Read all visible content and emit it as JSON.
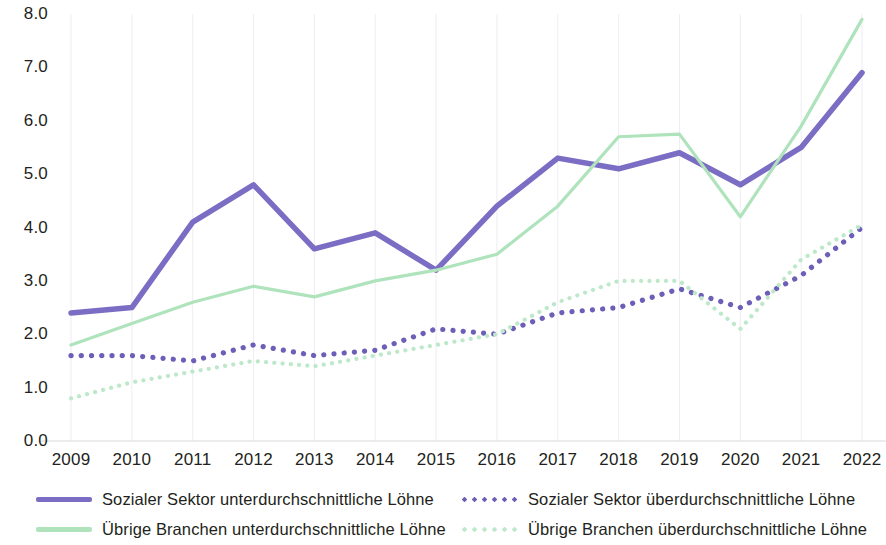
{
  "chart_data": {
    "type": "line",
    "title": "",
    "subtitle": "",
    "xlabel": "",
    "ylabel": "",
    "grid": "vertical-only",
    "legend_position": "bottom",
    "ylim": [
      0.0,
      8.0
    ],
    "ytick_labels": [
      "8.0",
      "7.0",
      "6.0",
      "5.0",
      "4.0",
      "3.0",
      "2.0",
      "1.0",
      "0.0"
    ],
    "ytick_values": [
      8.0,
      7.0,
      6.0,
      5.0,
      4.0,
      3.0,
      2.0,
      1.0,
      0.0
    ],
    "categories": [
      "2009",
      "2010",
      "2011",
      "2012",
      "2013",
      "2014",
      "2015",
      "2016",
      "2017",
      "2018",
      "2019",
      "2020",
      "2021",
      "2022"
    ],
    "x": [
      2009,
      2010,
      2011,
      2012,
      2013,
      2014,
      2015,
      2016,
      2017,
      2018,
      2019,
      2020,
      2021,
      2022
    ],
    "series": [
      {
        "name": "Sozialer Sektor unterdurchschnittliche Löhne",
        "color": "#7B6CC4",
        "style": "solid",
        "values": [
          2.4,
          2.5,
          4.1,
          4.8,
          3.6,
          3.9,
          3.2,
          4.4,
          5.3,
          5.1,
          5.4,
          4.8,
          5.5,
          6.9
        ]
      },
      {
        "name": "Sozialer Sektor überdurchschnittliche Löhne",
        "color": "#6D5FB8",
        "style": "dotted",
        "values": [
          1.6,
          1.6,
          1.5,
          1.8,
          1.6,
          1.7,
          2.1,
          2.0,
          2.4,
          2.5,
          2.85,
          2.5,
          3.1,
          4.0
        ]
      },
      {
        "name": "Übrige Branchen unterdurchschnittliche Löhne",
        "color": "#AEE3BC",
        "style": "solid",
        "values": [
          1.8,
          2.2,
          2.6,
          2.9,
          2.7,
          3.0,
          3.2,
          3.5,
          4.4,
          5.7,
          5.75,
          4.2,
          5.9,
          7.9
        ]
      },
      {
        "name": "Übrige Branchen überdurchschnittliche Löhne",
        "color": "#BEE8CA",
        "style": "dotted",
        "values": [
          0.8,
          1.1,
          1.3,
          1.5,
          1.4,
          1.6,
          1.8,
          2.0,
          2.6,
          3.0,
          3.0,
          2.1,
          3.4,
          4.05
        ]
      }
    ]
  },
  "legend": {
    "rows": [
      [
        {
          "label": "Sozialer Sektor unterdurchschnittliche Löhne",
          "color": "#7B6CC4",
          "style": "solid",
          "name": "legend-sozialer-sektor-unter"
        },
        {
          "label": "Sozialer Sektor überdurchschnittliche Löhne",
          "color": "#6D5FB8",
          "style": "dotted",
          "name": "legend-sozialer-sektor-ueber"
        }
      ],
      [
        {
          "label": "Übrige Branchen unterdurchschnittliche Löhne",
          "color": "#AEE3BC",
          "style": "solid",
          "name": "legend-uebrige-branchen-unter"
        },
        {
          "label": "Übrige Branchen überdurchschnittliche Löhne",
          "color": "#BEE8CA",
          "style": "dotted",
          "name": "legend-uebrige-branchen-ueber"
        }
      ]
    ]
  },
  "axes": {
    "gridline_color": "#EDEDF4",
    "axis_line_color": "#D8D8D8",
    "tick_text_color": "#231f20"
  }
}
